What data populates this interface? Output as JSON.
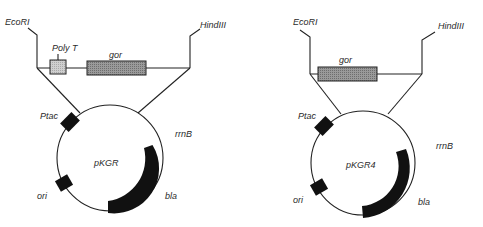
{
  "constructs": [
    {
      "plasmid_name": "pKGR",
      "sites": {
        "left": "EcoRI",
        "right": "HindIII"
      },
      "insert_elements": [
        {
          "label": "Poly T",
          "color": "#c8c8c8"
        },
        {
          "label": "gor",
          "color": "#8a8a8a"
        }
      ],
      "features": [
        {
          "label": "Ptac"
        },
        {
          "label": "ori"
        },
        {
          "label": "rrnB"
        },
        {
          "label": "bla"
        }
      ]
    },
    {
      "plasmid_name": "pKGR4",
      "sites": {
        "left": "EcoRI",
        "right": "HindIII"
      },
      "insert_elements": [
        {
          "label": "gor",
          "color": "#8a8a8a"
        }
      ],
      "features": [
        {
          "label": "Ptac"
        },
        {
          "label": "ori"
        },
        {
          "label": "rrnB"
        },
        {
          "label": "bla"
        }
      ]
    }
  ]
}
